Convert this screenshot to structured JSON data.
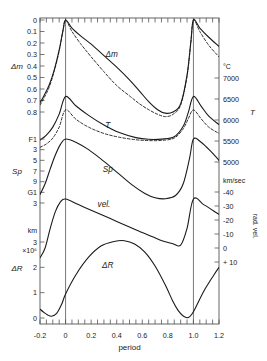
{
  "figure": {
    "x_axis": {
      "title": "period",
      "ticks": [
        "-0.2",
        "0",
        "0.2",
        "0.4",
        "0.6",
        "0.8",
        "1.0",
        "1.2"
      ],
      "tick_values": [
        -0.2,
        0,
        0.2,
        0.4,
        0.6,
        0.8,
        1.0,
        1.2
      ],
      "range": [
        -0.2,
        1.2
      ]
    },
    "left_axes": [
      {
        "name": "delta-m",
        "label": "Δm",
        "ticks": [
          "0",
          "0.1",
          "0.2",
          "0.3",
          "0.4",
          "0.5",
          "0.6",
          "0.7",
          "0.8"
        ]
      },
      {
        "name": "spectral-type",
        "label": "Sp",
        "ticks": [
          "F1",
          "3",
          "5",
          "7",
          "9",
          "G1",
          "3"
        ]
      },
      {
        "name": "delta-r",
        "label": "ΔR",
        "unit_top": "km",
        "unit_exp": "×10⁶",
        "ticks": [
          "3",
          "2",
          "1",
          "0"
        ]
      }
    ],
    "right_axes": [
      {
        "name": "temperature",
        "label": "T",
        "unit": "°C",
        "ticks": [
          "7000",
          "6500",
          "6000",
          "5500",
          "5000"
        ]
      },
      {
        "name": "radial-velocity",
        "label": "rad. vel.",
        "unit": "km/sec",
        "ticks": [
          "-40",
          "-30",
          "-20",
          "-10",
          "0",
          "+ 10"
        ]
      }
    ],
    "curve_labels": {
      "delta_m": "Δm",
      "temperature": "T",
      "spectral": "Sp",
      "velocity": "vel.",
      "delta_r": "ΔR"
    },
    "colors": {
      "line": "#1a1a1a",
      "frame": "#555555",
      "background": "#ffffff"
    }
  },
  "chart_data": {
    "type": "line",
    "title": "",
    "xlabel": "period",
    "ylabel": "",
    "xlim": [
      -0.2,
      1.2
    ],
    "grid": false,
    "legend": "none",
    "vertical_reference_lines": [
      0.0,
      1.0
    ],
    "series": [
      {
        "name": "Δm",
        "style": "solid",
        "ylabel": "Δm",
        "ylim": [
          0.85,
          -0.02
        ],
        "yticks": [
          0,
          0.1,
          0.2,
          0.3,
          0.4,
          0.5,
          0.6,
          0.7,
          0.8
        ],
        "x": [
          -0.2,
          -0.17,
          -0.13,
          -0.09,
          -0.05,
          -0.02,
          0.0,
          0.05,
          0.12,
          0.2,
          0.3,
          0.4,
          0.5,
          0.58,
          0.65,
          0.72,
          0.78,
          0.84,
          0.9,
          0.95,
          0.98,
          1.0,
          1.05,
          1.12,
          1.2
        ],
        "y": [
          0.72,
          0.66,
          0.57,
          0.44,
          0.26,
          0.09,
          0.0,
          0.07,
          0.14,
          0.21,
          0.31,
          0.41,
          0.52,
          0.62,
          0.71,
          0.78,
          0.81,
          0.8,
          0.73,
          0.48,
          0.19,
          0.0,
          0.07,
          0.15,
          0.23
        ]
      },
      {
        "name": "Δm-secondary",
        "style": "dashed",
        "x": [
          -0.2,
          -0.17,
          -0.13,
          -0.09,
          -0.05,
          -0.02,
          0.0,
          0.05,
          0.12,
          0.2,
          0.3,
          0.4,
          0.5,
          0.58,
          0.65,
          0.72,
          0.78,
          0.84,
          0.9,
          0.95,
          0.98,
          1.0,
          1.05,
          1.12,
          1.2
        ],
        "y": [
          0.74,
          0.68,
          0.59,
          0.45,
          0.27,
          0.09,
          0.0,
          0.1,
          0.21,
          0.32,
          0.45,
          0.57,
          0.66,
          0.73,
          0.78,
          0.82,
          0.84,
          0.82,
          0.74,
          0.49,
          0.19,
          0.0,
          0.1,
          0.22,
          0.32
        ]
      },
      {
        "name": "T",
        "style": "solid",
        "ylabel": "T",
        "unit": "°C",
        "ylim": [
          4750,
          7250
        ],
        "yticks": [
          5000,
          5500,
          6000,
          6500,
          7000
        ],
        "x": [
          -0.2,
          -0.15,
          -0.1,
          -0.05,
          0.0,
          0.08,
          0.18,
          0.3,
          0.42,
          0.55,
          0.65,
          0.75,
          0.85,
          0.92,
          0.96,
          1.0,
          1.06,
          1.12,
          1.2
        ],
        "y": [
          5520,
          5640,
          5830,
          6140,
          6560,
          6340,
          6110,
          5880,
          5700,
          5580,
          5540,
          5545,
          5600,
          5850,
          6180,
          6560,
          6330,
          6090,
          5890
        ]
      },
      {
        "name": "T-secondary",
        "style": "dashed",
        "x": [
          -0.2,
          -0.15,
          -0.1,
          -0.05,
          0.0,
          0.08,
          0.18,
          0.3,
          0.42,
          0.55,
          0.65,
          0.75,
          0.85,
          0.92,
          0.96,
          1.0,
          1.06,
          1.12,
          1.2
        ],
        "y": [
          5350,
          5430,
          5570,
          5830,
          6240,
          6020,
          5830,
          5680,
          5590,
          5530,
          5510,
          5515,
          5570,
          5790,
          6030,
          6240,
          6030,
          5830,
          5680
        ]
      },
      {
        "name": "Sp",
        "style": "solid",
        "ylabel": "Sp",
        "yticks_labels": [
          "F1",
          "3",
          "5",
          "7",
          "9",
          "G1",
          "3"
        ],
        "x": [
          -0.2,
          -0.16,
          -0.12,
          -0.08,
          -0.04,
          0.0,
          0.08,
          0.18,
          0.3,
          0.42,
          0.52,
          0.62,
          0.7,
          0.78,
          0.86,
          0.92,
          0.97,
          1.0,
          1.06,
          1.14,
          1.2
        ],
        "y": [
          6.2,
          5.2,
          3.8,
          2.5,
          1.5,
          1.0,
          1.3,
          2.0,
          3.1,
          4.3,
          5.3,
          6.1,
          6.5,
          6.6,
          6.3,
          5.2,
          2.8,
          1.0,
          1.3,
          2.2,
          3.0
        ]
      },
      {
        "name": "vel.",
        "style": "solid",
        "ylabel": "rad. vel.",
        "unit": "km/sec",
        "ylim": [
          15,
          -45
        ],
        "yticks": [
          -40,
          -30,
          -20,
          -10,
          0,
          10
        ],
        "x": [
          -0.2,
          -0.16,
          -0.12,
          -0.08,
          -0.04,
          0.0,
          0.1,
          0.2,
          0.3,
          0.4,
          0.5,
          0.6,
          0.68,
          0.76,
          0.84,
          0.9,
          0.95,
          1.0,
          1.08,
          1.15,
          1.2
        ],
        "y": [
          7,
          0,
          -14,
          -26,
          -33,
          -35,
          -31,
          -27,
          -23,
          -19,
          -15,
          -11,
          -8,
          -5,
          -3,
          -2,
          -14,
          -35,
          -31,
          -27,
          -24
        ]
      },
      {
        "name": "ΔR",
        "style": "solid",
        "ylabel": "ΔR",
        "unit": "km ×10⁶",
        "ylim": [
          -0.2,
          3.3
        ],
        "yticks": [
          0,
          1,
          2,
          3
        ],
        "x": [
          -0.2,
          -0.17,
          -0.14,
          -0.11,
          -0.07,
          -0.03,
          0.0,
          0.08,
          0.18,
          0.28,
          0.38,
          0.46,
          0.54,
          0.62,
          0.7,
          0.78,
          0.84,
          0.88,
          0.92,
          0.96,
          1.0,
          1.08,
          1.16,
          1.2
        ],
        "y": [
          0.35,
          0.22,
          0.12,
          0.07,
          0.18,
          0.55,
          0.95,
          1.7,
          2.4,
          2.85,
          3.02,
          3.05,
          2.92,
          2.6,
          2.05,
          1.3,
          0.65,
          0.3,
          0.08,
          0.02,
          0.25,
          1.05,
          1.7,
          2.0
        ]
      }
    ]
  }
}
